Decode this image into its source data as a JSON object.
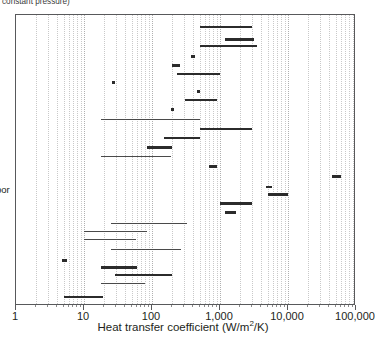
{
  "figure": {
    "caption_fragment": "constant pressure)",
    "y_label_fragment": "por"
  },
  "chart_data": {
    "type": "bar",
    "orientation": "horizontal-ranges",
    "title": "",
    "xlabel": "Heat transfer coefficient (W/m",
    "xlabel_sup": "2",
    "xlabel_tail": "/K)",
    "xlabel_full": "Heat transfer coefficient (W/m2/K)",
    "ylabel": "",
    "xscale": "log",
    "xlim": [
      1,
      100000
    ],
    "grid": "vertical-dotted-minor-and-major",
    "legend": "none",
    "xticks": [
      1,
      10,
      100,
      1000,
      10000,
      100000
    ],
    "xticklabels": [
      "1",
      "10",
      "100",
      "1,000",
      "10,000",
      "100,000"
    ],
    "categories": [],
    "series": [
      {
        "name": "range-01",
        "row": 1,
        "x_min": 500,
        "x_max": 3000,
        "kind": "bar"
      },
      {
        "name": "range-02",
        "row": 2,
        "x_min": 1200,
        "x_max": 3200,
        "kind": "bar-thick"
      },
      {
        "name": "range-03",
        "row": 3,
        "x_min": 500,
        "x_max": 3500,
        "kind": "bar"
      },
      {
        "name": "range-04",
        "row": 4,
        "x_min": 380,
        "x_max": 430,
        "kind": "bar-thick"
      },
      {
        "name": "range-05",
        "row": 5,
        "x_min": 200,
        "x_max": 260,
        "kind": "bar-thick"
      },
      {
        "name": "range-06",
        "row": 6,
        "x_min": 230,
        "x_max": 1000,
        "kind": "bar"
      },
      {
        "name": "point-07",
        "row": 7,
        "x_min": 27,
        "x_max": 27,
        "kind": "dot"
      },
      {
        "name": "point-08",
        "row": 8,
        "x_min": 480,
        "x_max": 480,
        "kind": "dot"
      },
      {
        "name": "range-09",
        "row": 9,
        "x_min": 310,
        "x_max": 900,
        "kind": "bar"
      },
      {
        "name": "point-10",
        "row": 10,
        "x_min": 200,
        "x_max": 200,
        "kind": "dot"
      },
      {
        "name": "range-11",
        "row": 11,
        "x_min": 18,
        "x_max": 500,
        "kind": "bar-thin"
      },
      {
        "name": "range-12",
        "row": 12,
        "x_min": 500,
        "x_max": 3000,
        "kind": "bar"
      },
      {
        "name": "range-13",
        "row": 13,
        "x_min": 150,
        "x_max": 500,
        "kind": "bar"
      },
      {
        "name": "range-14",
        "row": 14,
        "x_min": 85,
        "x_max": 195,
        "kind": "bar-thick"
      },
      {
        "name": "range-15",
        "row": 15,
        "x_min": 18,
        "x_max": 190,
        "kind": "bar-thin"
      },
      {
        "name": "range-16",
        "row": 16,
        "x_min": 700,
        "x_max": 900,
        "kind": "bar-thick"
      },
      {
        "name": "range-17",
        "row": 17,
        "x_min": 45000,
        "x_max": 60000,
        "kind": "bar-thick"
      },
      {
        "name": "range-18",
        "row": 18,
        "x_min": 4800,
        "x_max": 5800,
        "kind": "bar"
      },
      {
        "name": "range-19",
        "row": 19,
        "x_min": 5000,
        "x_max": 10000,
        "kind": "bar-thick"
      },
      {
        "name": "range-20",
        "row": 20,
        "x_min": 1000,
        "x_max": 3000,
        "kind": "bar-thick"
      },
      {
        "name": "range-21",
        "row": 21,
        "x_min": 1200,
        "x_max": 1700,
        "kind": "bar-thick"
      },
      {
        "name": "range-22",
        "row": 22,
        "x_min": 25,
        "x_max": 330,
        "kind": "bar-thin"
      },
      {
        "name": "range-23",
        "row": 23,
        "x_min": 10,
        "x_max": 85,
        "kind": "bar-thin"
      },
      {
        "name": "range-24",
        "row": 24,
        "x_min": 10,
        "x_max": 58,
        "kind": "bar-thin"
      },
      {
        "name": "range-25",
        "row": 25,
        "x_min": 25,
        "x_max": 270,
        "kind": "bar-thin"
      },
      {
        "name": "range-26",
        "row": 26,
        "x_min": 4.7,
        "x_max": 5.6,
        "kind": "bar-thick"
      },
      {
        "name": "range-27",
        "row": 27,
        "x_min": 18,
        "x_max": 60,
        "kind": "bar-thick"
      },
      {
        "name": "range-28",
        "row": 28,
        "x_min": 29,
        "x_max": 195,
        "kind": "bar"
      },
      {
        "name": "range-29",
        "row": 29,
        "x_min": 18,
        "x_max": 80,
        "kind": "bar-thin"
      },
      {
        "name": "range-30",
        "row": 30,
        "x_min": 5,
        "x_max": 19,
        "kind": "bar"
      }
    ],
    "row_y_px": [
      25,
      37,
      44,
      54,
      63,
      72,
      81,
      90,
      98,
      108,
      118,
      127,
      136,
      145,
      155,
      164,
      174,
      185,
      192,
      201,
      210,
      222,
      230,
      238,
      248,
      258,
      265,
      273,
      282,
      295
    ],
    "minor_tick_multipliers": [
      2,
      3,
      4,
      5,
      6,
      7,
      8,
      9
    ]
  }
}
